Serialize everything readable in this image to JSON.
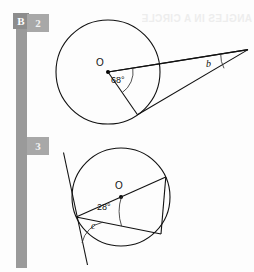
{
  "page": {
    "section_letter": "B",
    "background_color": "#fdfdfd",
    "ink_color": "#111111",
    "rail_color": "#9a9a9a",
    "marker_color": "#a8a8a8",
    "bleed_text": "ANGLES IN A CIRCLE"
  },
  "problems": [
    {
      "number": "2",
      "figure": {
        "type": "circle-diagram",
        "center_label": "O",
        "known_angle": "68°",
        "unknown_angle": "b",
        "description": "Circle with centre O. Two tangents from an external point meet the circle; the central angle between the radii to the points of contact is 68° and the angle between the tangents at the external point is b."
      }
    },
    {
      "number": "3",
      "figure": {
        "type": "circle-diagram",
        "center_label": "O",
        "known_angle": "28°",
        "unknown_angle": "c",
        "description": "Circle with centre O. A tangent touches the circle at a point on the left; a diameter through O and a chord are drawn from that point. The angle between the diameter and the chord is 28° and the angle between the tangent and the chord is c."
      }
    }
  ]
}
